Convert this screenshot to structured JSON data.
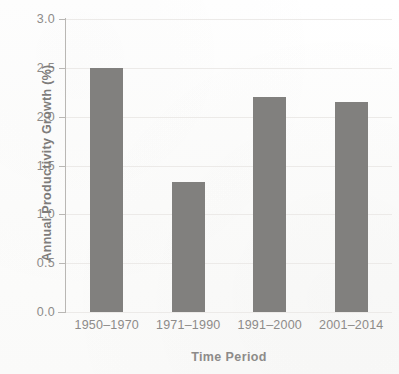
{
  "chart_data": {
    "type": "bar",
    "title": "",
    "subtitle": "",
    "xlabel": "Time Period",
    "ylabel": "Annual Productivity Growth (%)",
    "categories": [
      "1950–1970",
      "1971–1990",
      "1991–2000",
      "2001–2014"
    ],
    "values": [
      2.5,
      1.33,
      2.2,
      2.15
    ],
    "series": [
      {
        "name": "Annual Productivity Growth (%)",
        "values": [
          2.5,
          1.33,
          2.2,
          2.15
        ]
      }
    ],
    "ylim": [
      0.0,
      3.0
    ],
    "ytick_values": [
      0.0,
      0.5,
      1.0,
      1.5,
      2.0,
      2.5,
      3.0
    ],
    "ytick_labels": [
      "0.0",
      "0.5",
      "1.0",
      "1.5",
      "2.0",
      "2.5",
      "3.0"
    ],
    "grid": true,
    "grid_axis": "y",
    "legend": false,
    "legend_position": "none",
    "bar_color": "#81807e",
    "text_color": "#8d8b89",
    "axis_color": "#b9b7b4",
    "grid_color": "#eceae8",
    "background_color": "#fdfdfc"
  }
}
